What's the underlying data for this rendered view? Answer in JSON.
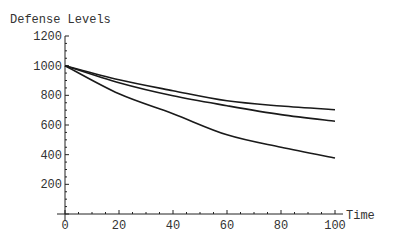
{
  "chart_data": {
    "type": "line",
    "title": "",
    "ylabel": "Defense Levels",
    "xlabel": "Time",
    "xlim": [
      0,
      100
    ],
    "ylim": [
      0,
      1200
    ],
    "x_ticks": [
      0,
      20,
      40,
      60,
      80,
      100
    ],
    "y_ticks": [
      200,
      400,
      600,
      800,
      1000,
      1200
    ],
    "grid": false,
    "legend": null,
    "x": [
      0,
      20,
      40,
      60,
      80,
      100
    ],
    "series": [
      {
        "name": "curve-1",
        "values": [
          1000,
          905,
          831,
          763,
          728,
          703
        ]
      },
      {
        "name": "curve-2",
        "values": [
          1000,
          885,
          797,
          730,
          670,
          625
        ]
      },
      {
        "name": "curve-3",
        "values": [
          1000,
          810,
          676,
          534,
          450,
          378
        ]
      }
    ]
  }
}
